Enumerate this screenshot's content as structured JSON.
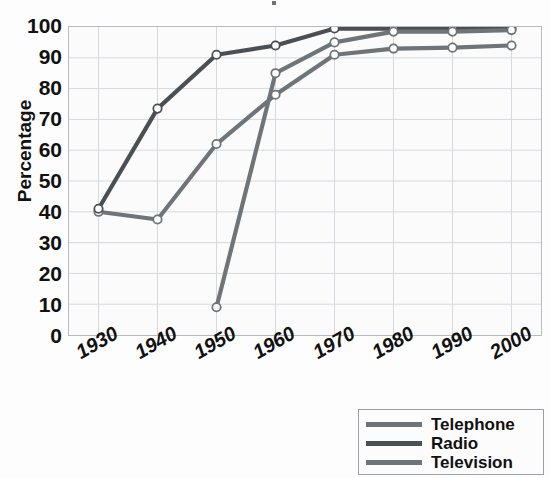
{
  "chart_data": {
    "type": "line",
    "title": "",
    "xlabel": "",
    "ylabel": "Percentage",
    "categories": [
      1930,
      1940,
      1950,
      1960,
      1970,
      1980,
      1990,
      2000
    ],
    "xlim": [
      1925,
      2005
    ],
    "ylim": [
      0,
      100
    ],
    "grid": true,
    "legend_position": "bottom-right",
    "series": [
      {
        "name": "Telephone",
        "color": "#6e7478",
        "values": [
          40.0,
          37.5,
          62.0,
          78.0,
          91.0,
          93.0,
          93.3,
          94.0
        ]
      },
      {
        "name": "Radio",
        "color": "#4a4f54",
        "values": [
          41.0,
          73.5,
          91.0,
          94.0,
          99.5,
          99.5,
          99.5,
          99.5
        ]
      },
      {
        "name": "Television",
        "color": "#6e7478",
        "values": [
          null,
          null,
          9.0,
          85.0,
          95.0,
          98.5,
          98.5,
          99.0
        ]
      }
    ],
    "ytick_labels": [
      "100",
      "90",
      "80",
      "70",
      "60",
      "50",
      "40",
      "30",
      "20",
      "10",
      "0"
    ],
    "ytick_values": [
      100,
      90,
      80,
      70,
      60,
      50,
      40,
      30,
      20,
      10,
      0
    ],
    "xtick_labels": [
      "1930",
      "1940",
      "1950",
      "1960",
      "1970",
      "1980",
      "1990",
      "2000"
    ],
    "marker": "open-circle"
  },
  "legend": {
    "items": [
      {
        "label": "Telephone",
        "color": "#6e7478"
      },
      {
        "label": "Radio",
        "color": "#4a4f54"
      },
      {
        "label": "Television",
        "color": "#6e7478"
      }
    ]
  },
  "axes": {
    "y_title": "Percentage"
  },
  "colors": {
    "plot_background": "#fbfbfb",
    "grid": "#d6d9dd",
    "border": "#b8bcc2",
    "text": "#111111",
    "telephone": "#6e7478",
    "radio": "#4a4f54",
    "television": "#6e7478"
  }
}
